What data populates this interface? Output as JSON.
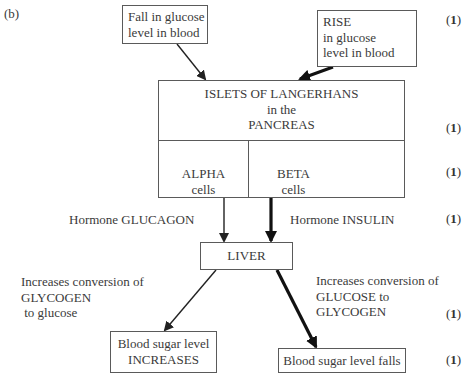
{
  "part_label": "(b)",
  "boxes": {
    "fall": {
      "line1": "Fall in glucose",
      "line2": "level in blood"
    },
    "rise": {
      "line1": "RISE",
      "line2": "in glucose",
      "line3": "level in blood"
    },
    "islets": {
      "line1": "ISLETS OF LANGERHANS",
      "line2": "in the",
      "line3": "PANCREAS"
    },
    "alpha": {
      "line1": "ALPHA",
      "line2": "cells"
    },
    "beta": {
      "line1": "BETA",
      "line2": "cells"
    },
    "liver": {
      "label": "LIVER"
    },
    "increases": {
      "line1": "Blood sugar level",
      "line2": "INCREASES"
    },
    "falls": {
      "label": "Blood sugar level falls"
    }
  },
  "labels": {
    "glucagon": "Hormone GLUCAGON",
    "insulin": "Hormone INSULIN",
    "left_effect": {
      "line1": "Increases conversion of",
      "line2": "GLYCOGEN",
      "line3": " to glucose"
    },
    "right_effect": {
      "line1": "Increases conversion of",
      "line2": "GLUCOSE to",
      "line3": "GLYCOGEN"
    }
  },
  "marks": {
    "open": "(",
    "value": "1",
    "close": ")"
  }
}
